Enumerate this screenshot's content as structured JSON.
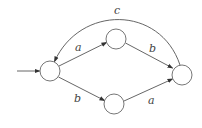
{
  "diagram": {
    "type": "finite-automaton",
    "colors": {
      "stroke": "#555555",
      "label": "#444444",
      "background": "#ffffff"
    },
    "nodes": [
      {
        "id": "q0",
        "cx": 50,
        "cy": 71,
        "r": 10,
        "initial": true
      },
      {
        "id": "q1",
        "cx": 116,
        "cy": 39,
        "r": 10
      },
      {
        "id": "q2",
        "cx": 114,
        "cy": 104,
        "r": 10
      },
      {
        "id": "q3",
        "cx": 182,
        "cy": 75,
        "r": 10
      }
    ],
    "edges": [
      {
        "from": "q0",
        "to": "q1",
        "label": "a"
      },
      {
        "from": "q1",
        "to": "q3",
        "label": "b"
      },
      {
        "from": "q0",
        "to": "q2",
        "label": "b"
      },
      {
        "from": "q2",
        "to": "q3",
        "label": "a"
      },
      {
        "from": "q3",
        "to": "q0",
        "label": "c"
      }
    ],
    "labels": {
      "c_top": "c",
      "a_upper_left": "a",
      "b_upper_right": "b",
      "b_lower_left": "b",
      "a_lower_right": "a"
    }
  }
}
